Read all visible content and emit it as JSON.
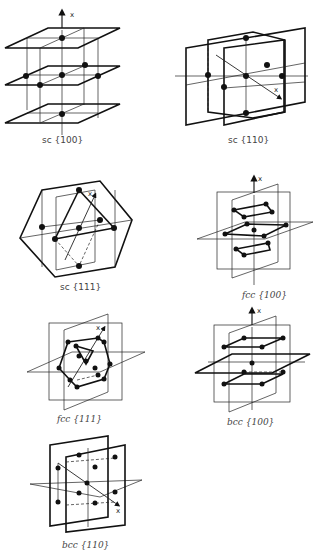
{
  "figure": {
    "panels": [
      {
        "id": "sc-100",
        "lattice": "sc",
        "planes": "{100}",
        "label": "sc {100}",
        "axis": "x"
      },
      {
        "id": "sc-110",
        "lattice": "sc",
        "planes": "{110}",
        "label": "sc {110}",
        "axis": "x"
      },
      {
        "id": "sc-111",
        "lattice": "sc",
        "planes": "{111}",
        "label": "sc {111}",
        "axis": "x"
      },
      {
        "id": "fcc-100",
        "lattice": "fcc",
        "planes": "{100}",
        "label": "fcc {100}",
        "axis": "x"
      },
      {
        "id": "fcc-111",
        "lattice": "fcc",
        "planes": "{111}",
        "label": "fcc {111}",
        "axis": "x"
      },
      {
        "id": "bcc-100",
        "lattice": "bcc",
        "planes": "{100}",
        "label": "bcc {100}",
        "axis": "x"
      },
      {
        "id": "bcc-110",
        "lattice": "bcc",
        "planes": "{110}",
        "label": "bcc {110}",
        "axis": "x"
      }
    ]
  }
}
